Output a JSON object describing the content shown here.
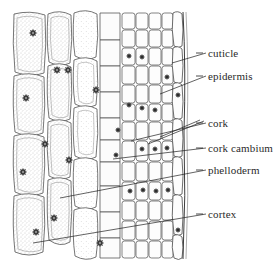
{
  "figure": {
    "type": "labelled-botanical-diagram",
    "background_color": "#ffffff",
    "ink_color": "#3a3a3a",
    "label_color": "#2a2a2a",
    "width": 280,
    "height": 270
  },
  "labels": [
    {
      "id": "cuticle",
      "text": "cuticle",
      "x": 208,
      "y": 48,
      "dash_x": 196,
      "dash_y": 53,
      "leader": {
        "x1": 206,
        "y1": 53,
        "x2": 172,
        "y2": 63
      }
    },
    {
      "id": "epidermis",
      "text": "epidermis",
      "x": 208,
      "y": 71,
      "dash_x": 196,
      "dash_y": 76,
      "leader": {
        "x1": 206,
        "y1": 76,
        "x2": 160,
        "y2": 94
      }
    },
    {
      "id": "cork",
      "text": "cork",
      "x": 208,
      "y": 118,
      "dash_x": 196,
      "dash_y": 123,
      "leader": {
        "x1": 206,
        "y1": 123,
        "x2": 131,
        "y2": 141
      }
    },
    {
      "id": "cork-cambium",
      "text": "cork cambium",
      "x": 208,
      "y": 143,
      "dash_x": 196,
      "dash_y": 148,
      "leader": {
        "x1": 206,
        "y1": 148,
        "x2": 113,
        "y2": 159
      }
    },
    {
      "id": "phelloderm",
      "text": "phelloderm",
      "x": 208,
      "y": 165,
      "dash_x": 196,
      "dash_y": 170,
      "leader": {
        "x1": 206,
        "y1": 170,
        "x2": 60,
        "y2": 198
      }
    },
    {
      "id": "cortex",
      "text": "cortex",
      "x": 208,
      "y": 209,
      "dash_x": 196,
      "dash_y": 214,
      "leader": {
        "x1": 206,
        "y1": 214,
        "x2": 33,
        "y2": 243
      }
    }
  ],
  "extra_leaders": [
    {
      "id": "cork-leader-b",
      "x1": 204,
      "y1": 121,
      "x2": 148,
      "y2": 144
    },
    {
      "id": "cork-leader-c",
      "x1": 200,
      "y1": 120,
      "x2": 160,
      "y2": 137
    }
  ],
  "tissue_regions": [
    {
      "id": "cortex-zone",
      "label": "cortex",
      "x": 12,
      "width": 58,
      "cell_style": "large-elongated-stippled"
    },
    {
      "id": "phelloderm-zone",
      "label": "phelloderm",
      "x": 70,
      "width": 30,
      "cell_style": "large-vacuolate"
    },
    {
      "id": "cambium-zone",
      "label": "cork cambium",
      "x": 100,
      "width": 22,
      "cell_style": "narrow-dividing"
    },
    {
      "id": "cork-zone",
      "label": "cork",
      "x": 122,
      "width": 40,
      "cell_style": "brick-rows"
    },
    {
      "id": "epidermis-zone",
      "label": "epidermis",
      "x": 162,
      "width": 16,
      "cell_style": "outer-column"
    },
    {
      "id": "cuticle-zone",
      "label": "cuticle",
      "x": 178,
      "width": 5,
      "cell_style": "thin-outer-layer"
    }
  ],
  "drawing": {
    "style": "pen-and-ink stipple line drawing",
    "nucleus_count_visible": 28,
    "nucleus_appearance": "dark star-shaped blob"
  }
}
